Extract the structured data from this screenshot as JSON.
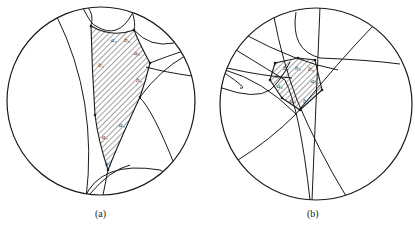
{
  "figure": {
    "stroke_color": "#1a1a1a",
    "hatch_color": "#333333",
    "panels": [
      {
        "id": "a",
        "caption": "(a)",
        "caption_pos": [
          95,
          208
        ],
        "disk": {
          "cx": 101,
          "cy": 101,
          "r": 94
        },
        "geodesics": [
          "M 57 17 Q 98 100 86 199",
          "M 83 8 Q 92 26 96 26 Q 118 40 132 14",
          "M 88 7 Q 94 16 91 25",
          "M 132 11 Q 136 24 134 30",
          "M 134 30 Q 150 48 174 43",
          "M 150 63 Q 165 57 186 50",
          "M 146 67 Q 164 72 192 76",
          "M 139 97 Q 152 108 175 166",
          "M 140 97 Q 160 70 185 56",
          "M 84 199 Q 100 160 160 170 Q 180 180 183 186",
          "M 89 195 Q 110 170 130 165",
          "M 108 170 L 102 200"
        ],
        "polygon": "M 91 26 Q 112 38 134 30 Q 140 45 150 63 Q 146 80 140 97 Q 120 140 108 170 Q 98 140 95 115 Q 92 70 91 26 Z",
        "vertices": [
          [
            91,
            26
          ],
          [
            134,
            30
          ],
          [
            150,
            63
          ],
          [
            140,
            97
          ],
          [
            108,
            170
          ],
          [
            95,
            115
          ]
        ],
        "labels": [
          {
            "text": "a₂",
            "x": 111,
            "y": 42
          },
          {
            "text": "b₃",
            "x": 124,
            "y": 42
          },
          {
            "text": "a₃",
            "x": 134,
            "y": 55
          },
          {
            "text": "b₁",
            "x": 98,
            "y": 67
          },
          {
            "text": "b₂",
            "x": 136,
            "y": 82
          },
          {
            "text": "a₄",
            "x": 119,
            "y": 127
          },
          {
            "text": "a₁",
            "x": 102,
            "y": 139
          },
          {
            "text": "b₄",
            "x": 105,
            "y": 166
          }
        ]
      },
      {
        "id": "b",
        "caption": "(b)",
        "caption_pos": [
          307,
          208
        ],
        "disk": {
          "cx": 316,
          "cy": 104,
          "r": 96
        },
        "geodesics": [
          "M 320 7 L 312 200",
          "M 274 17 Q 282 60 297 100 Q 318 150 346 196",
          "M 296 12 Q 290 50 320 58 Q 370 60 400 64",
          "M 244 34 Q 296 62 338 70",
          "M 236 50 Q 272 72 285 80 Q 300 110 310 200",
          "M 227 68 Q 262 76 292 78",
          "M 223 72 Q 250 90 240 88",
          "M 222 88 Q 255 100 270 90 Q 280 82 290 62",
          "M 372 27 Q 340 60 296 114 Q 270 140 238 160",
          "M 225 70 Q 262 80 296 114"
        ],
        "polygon": "M 275 63 L 298 58 L 315 60 L 322 90 L 300 110 L 282 98 L 270 80 Z",
        "vertices": [
          [
            275,
            63
          ],
          [
            298,
            58
          ],
          [
            315,
            60
          ],
          [
            322,
            90
          ],
          [
            300,
            110
          ],
          [
            282,
            98
          ],
          [
            270,
            80
          ]
        ],
        "labels": [
          {
            "text": "b₁",
            "x": 283,
            "y": 70
          },
          {
            "text": "b₂",
            "x": 295,
            "y": 70
          },
          {
            "text": "b₃",
            "x": 308,
            "y": 71
          },
          {
            "text": "a₁",
            "x": 275,
            "y": 78
          },
          {
            "text": "a₂",
            "x": 277,
            "y": 88
          },
          {
            "text": "a₃",
            "x": 311,
            "y": 83
          },
          {
            "text": "a₄",
            "x": 290,
            "y": 103
          },
          {
            "text": "b₄",
            "x": 303,
            "y": 103
          }
        ]
      }
    ]
  }
}
